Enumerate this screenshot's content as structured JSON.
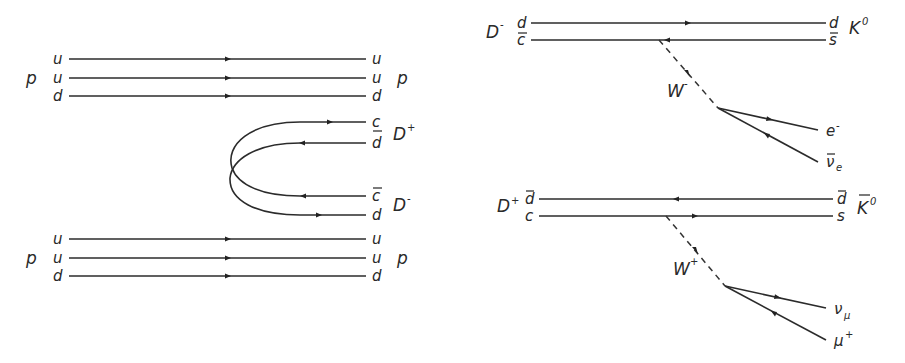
{
  "left_diagram": {
    "top_proton": {
      "hadron_in": "p",
      "hadron_out": "p",
      "quarks_in": [
        "u",
        "u",
        "d"
      ],
      "quarks_out": [
        "u",
        "u",
        "d"
      ]
    },
    "d_plus_pair": {
      "hadron": "D",
      "charge": "+",
      "quarks": [
        "c",
        "d"
      ],
      "bars": [
        false,
        true
      ]
    },
    "d_minus_pair": {
      "hadron": "D",
      "charge": "-",
      "quarks": [
        "c",
        "d"
      ],
      "bars": [
        true,
        false
      ]
    },
    "bottom_proton": {
      "hadron_in": "p",
      "hadron_out": "p",
      "quarks_in": [
        "u",
        "u",
        "d"
      ],
      "quarks_out": [
        "u",
        "u",
        "d"
      ]
    }
  },
  "right_top_diagram": {
    "initial_hadron": "D",
    "initial_charge": "-",
    "quarks_in": [
      "d",
      "c"
    ],
    "quarks_in_bars": [
      false,
      true
    ],
    "quarks_out": [
      "d",
      "s"
    ],
    "quarks_out_bars": [
      false,
      true
    ],
    "final_hadron": "K",
    "final_superscript": "0",
    "boson": "W",
    "boson_charge": "-",
    "lepton_1": "e",
    "lepton_1_sup": "-",
    "lepton_2": "ν",
    "lepton_2_sub": "e"
  },
  "right_bottom_diagram": {
    "initial_hadron": "D",
    "initial_charge": "+",
    "quarks_in": [
      "d",
      "c"
    ],
    "quarks_in_bars": [
      true,
      false
    ],
    "quarks_out": [
      "d",
      "s"
    ],
    "quarks_out_bars": [
      true,
      false
    ],
    "final_hadron": "K",
    "final_superscript": "0",
    "boson": "W",
    "boson_charge": "+",
    "lepton_1": "ν",
    "lepton_1_sub": "μ",
    "lepton_2": "μ",
    "lepton_2_sup": "+"
  }
}
